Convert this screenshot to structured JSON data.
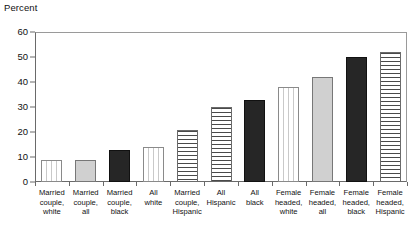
{
  "chart_data": {
    "type": "bar",
    "title": "",
    "subtitle": "",
    "xlabel": "",
    "ylabel": "Percent",
    "ylim": [
      0,
      60
    ],
    "ytick_labels": [
      "60",
      "50",
      "40",
      "30",
      "20",
      "10",
      "0"
    ],
    "ytick_values": [
      60,
      50,
      40,
      30,
      20,
      10,
      0
    ],
    "ygrid": false,
    "legend": null,
    "categories": [
      "Married couple, white",
      "Married couple, all",
      "Married couple, black",
      "All white",
      "Married couple, Hispanic",
      "All Hispanic",
      "All black",
      "Female headed, white",
      "Female headed, all",
      "Female headed, black",
      "Female headed, Hispanic"
    ],
    "category_lines": [
      [
        "Married",
        "couple,",
        "white"
      ],
      [
        "Married",
        "couple,",
        "all"
      ],
      [
        "Married",
        "couple,",
        "black"
      ],
      [
        "All",
        "white"
      ],
      [
        "Married",
        "couple,",
        "Hispanic"
      ],
      [
        "All",
        "Hispanic"
      ],
      [
        "All",
        "black"
      ],
      [
        "Female",
        "headed,",
        "white"
      ],
      [
        "Female",
        "headed,",
        "all"
      ],
      [
        "Female",
        "headed,",
        "black"
      ],
      [
        "Female",
        "headed,",
        "Hispanic"
      ]
    ],
    "values": [
      9,
      9,
      13,
      14,
      21,
      30,
      33,
      38,
      42,
      50,
      52
    ],
    "bar_patterns": [
      "vertical-dashed",
      "solid-gray",
      "solid-black",
      "vertical-dashed",
      "horizontal-lines",
      "horizontal-lines",
      "solid-black",
      "vertical-dashed",
      "solid-gray",
      "solid-black",
      "horizontal-lines"
    ],
    "colors": {
      "solid_black": "#262626",
      "solid_gray": "#d0d0d0",
      "pattern_white": "#ffffff",
      "axis": "#6a6a6a",
      "frame": "#9a9a9a",
      "text": "#111111"
    }
  },
  "bars": [
    {
      "label_lines": "Married\ncouple,\nwhite",
      "value": 9,
      "pattern": "vertical-dashed"
    },
    {
      "label_lines": "Married\ncouple,\nall",
      "value": 9,
      "pattern": "solid-gray"
    },
    {
      "label_lines": "Married\ncouple,\nblack",
      "value": 13,
      "pattern": "solid-black"
    },
    {
      "label_lines": "All\nwhite",
      "value": 14,
      "pattern": "vertical-dashed"
    },
    {
      "label_lines": "Married\ncouple,\nHispanic",
      "value": 21,
      "pattern": "horizontal-lines"
    },
    {
      "label_lines": "All\nHispanic",
      "value": 30,
      "pattern": "horizontal-lines"
    },
    {
      "label_lines": "All\nblack",
      "value": 33,
      "pattern": "solid-black"
    },
    {
      "label_lines": "Female\nheaded,\nwhite",
      "value": 38,
      "pattern": "vertical-dashed"
    },
    {
      "label_lines": "Female\nheaded,\nall",
      "value": 42,
      "pattern": "solid-gray"
    },
    {
      "label_lines": "Female\nheaded,\nblack",
      "value": 50,
      "pattern": "solid-black"
    },
    {
      "label_lines": "Female\nheaded,\nHispanic",
      "value": 52,
      "pattern": "horizontal-lines"
    }
  ],
  "axis": {
    "y_title": "Percent",
    "y_ticks": [
      "60",
      "50",
      "40",
      "30",
      "20",
      "10",
      "0"
    ]
  }
}
